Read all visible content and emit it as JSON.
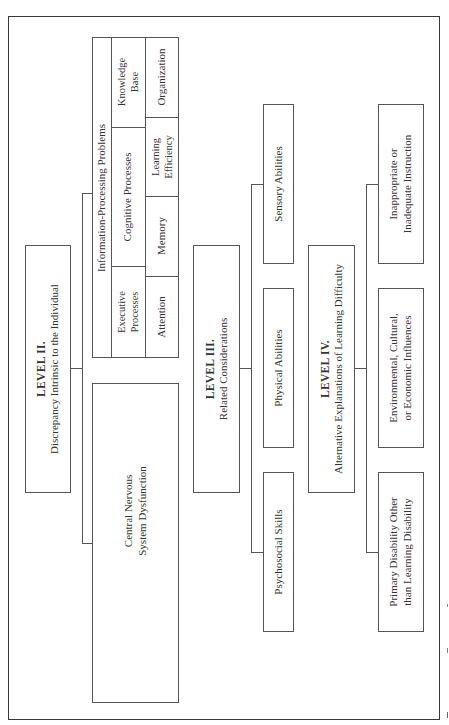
{
  "diagram": {
    "level2": {
      "title": "LEVEL II.",
      "subtitle": "Discrepancy Intrinsic to the Individual",
      "children": {
        "info_processing": {
          "title": "Information-Processing Problems",
          "cells": {
            "knowledge_base": [
              "Knowledge",
              "Base"
            ],
            "cognitive_processes": "Cognitive Processes",
            "executive_processes": [
              "Executive",
              "Processes"
            ],
            "organization": "Organization",
            "learning_efficiency": [
              "Learning",
              "Efficiency"
            ],
            "memory": "Memory",
            "attention": "Attention"
          }
        },
        "cns": [
          "Central Nervous",
          "System Dysfunction"
        ]
      }
    },
    "level3": {
      "title": "LEVEL III.",
      "subtitle": "Related Considerations",
      "children": {
        "sensory": "Sensory Abilities",
        "physical": "Physical Abilities",
        "psychosocial": "Psychosocial Skills"
      }
    },
    "level4": {
      "title": "LEVEL IV.",
      "subtitle": "Alternative Explanations of Learning Difficulty",
      "children": {
        "instruction": [
          "Inappropriate or",
          "Inadequate Instruction"
        ],
        "environmental": [
          "Environmental, Cultural,",
          "or Economic Influences"
        ],
        "primary_disability": [
          "Primary Disability Other",
          "than Learning Disability"
        ]
      }
    },
    "orientation": "rotated 90deg counter-clockwise"
  }
}
